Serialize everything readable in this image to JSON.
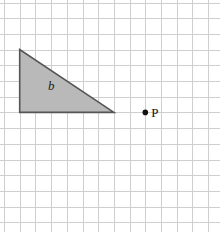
{
  "diagram": {
    "type": "grid-geometry",
    "grid": {
      "origin_x": 4,
      "origin_y": 2.5,
      "cell_size": 15.7,
      "columns": 14,
      "rows": 15,
      "line_color": "#cfcfcf"
    },
    "shapes": [
      {
        "id": "b",
        "kind": "right-triangle",
        "label": "b",
        "vertices_grid": [
          [
            1,
            3
          ],
          [
            1,
            7
          ],
          [
            7,
            7
          ]
        ],
        "fill": "#b9b9b9",
        "stroke": "#555555",
        "label_grid": [
          2.8,
          5.6
        ]
      }
    ],
    "points": [
      {
        "id": "P",
        "label": "P",
        "position_grid": [
          9,
          7
        ],
        "color": "#111111"
      }
    ]
  }
}
